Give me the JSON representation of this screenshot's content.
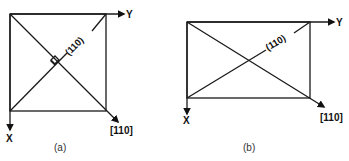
{
  "figures": [
    {
      "id": "a",
      "caption": "(a)",
      "shape": "square",
      "axis_x_label": "X",
      "axis_y_label": "Y",
      "plane_label": "(110)",
      "direction_label": "[110]",
      "right_angle_marker": true
    },
    {
      "id": "b",
      "caption": "(b)",
      "shape": "rectangle",
      "axis_x_label": "X",
      "axis_y_label": "Y",
      "plane_label": "(110)",
      "direction_label": "[110]",
      "right_angle_marker": false
    }
  ],
  "colors": {
    "line": "#1a1a1a",
    "background": "#ffffff"
  }
}
